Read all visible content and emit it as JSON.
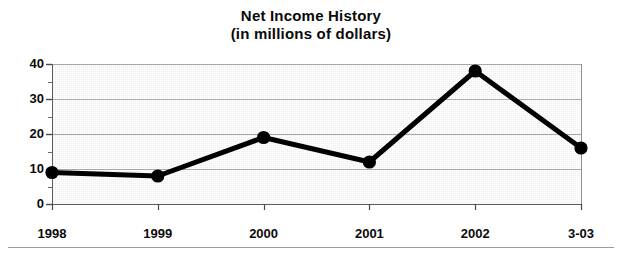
{
  "chart_data": {
    "type": "line",
    "title": "Net Income History (in millions of dollars)",
    "title_lines": [
      "Net Income History",
      "(in millions of dollars)"
    ],
    "xlabel": "",
    "ylabel": "",
    "categories": [
      "1998",
      "1999",
      "2000",
      "2001",
      "2002",
      "3-03"
    ],
    "values": [
      9,
      8,
      19,
      12,
      38,
      16
    ],
    "series": [
      {
        "name": "Net Income",
        "values": [
          9,
          8,
          19,
          12,
          38,
          16
        ]
      }
    ],
    "ylim": [
      0,
      40
    ],
    "xlim": [
      0,
      5
    ],
    "y_ticks": [
      0,
      10,
      20,
      30,
      40
    ],
    "y_tick_labels": [
      "0",
      "10",
      "20",
      "30",
      "40"
    ],
    "y_minor_ticks": [
      5,
      15,
      25,
      35
    ],
    "x_tick_labels": [
      "1998",
      "1999",
      "2000",
      "2001",
      "2002",
      "3-03"
    ],
    "grid": true,
    "grid_axis": "y",
    "legend": false,
    "legend_position": "none",
    "marker": "circle",
    "line_color": "#000000",
    "marker_color": "#000000",
    "plot_background": "#ededed",
    "axis_color": "#6e6e6e",
    "text_color": "#0b0b0b"
  },
  "figure": {
    "background": "#ffffff",
    "bottom_rule_color": "#9a9a9a"
  }
}
